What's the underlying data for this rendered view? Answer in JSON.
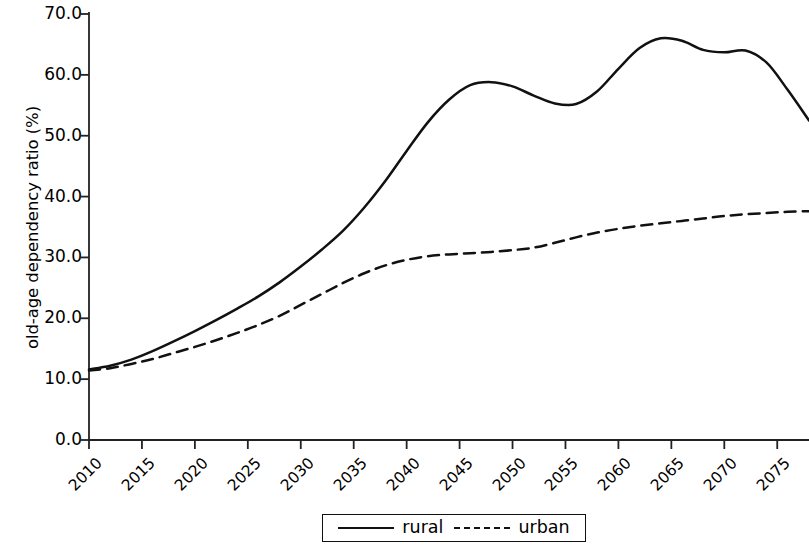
{
  "chart_data": {
    "type": "line",
    "title": "",
    "xlabel": "",
    "ylabel": "old-age dependency ratio (%)",
    "xlim": [
      2010,
      2078
    ],
    "ylim": [
      0.0,
      70.0
    ],
    "grid": false,
    "legend_position": "bottom-center",
    "x_tick_labels": [
      "2010",
      "2015",
      "2020",
      "2025",
      "2030",
      "2035",
      "2040",
      "2045",
      "2050",
      "2055",
      "2060",
      "2065",
      "2070",
      "2075"
    ],
    "y_tick_labels": [
      "0.0",
      "10.0",
      "20.0",
      "30.0",
      "40.0",
      "50.0",
      "60.0",
      "70.0"
    ],
    "y_tick_values": [
      0.0,
      10.0,
      20.0,
      30.0,
      40.0,
      50.0,
      60.0,
      70.0
    ],
    "x": [
      2010,
      2012,
      2014,
      2016,
      2018,
      2020,
      2022,
      2024,
      2026,
      2028,
      2030,
      2032,
      2034,
      2036,
      2038,
      2040,
      2042,
      2044,
      2046,
      2048,
      2050,
      2052,
      2054,
      2056,
      2058,
      2060,
      2062,
      2064,
      2066,
      2068,
      2070,
      2072,
      2074,
      2076,
      2078
    ],
    "series": [
      {
        "name": "rural",
        "style": "solid",
        "color": "#111111",
        "values": [
          11.6,
          12.2,
          13.2,
          14.6,
          16.2,
          17.9,
          19.7,
          21.6,
          23.6,
          25.9,
          28.5,
          31.3,
          34.4,
          38.2,
          42.6,
          47.5,
          52.2,
          55.9,
          58.3,
          58.8,
          58.1,
          56.6,
          55.3,
          55.2,
          57.3,
          61.0,
          64.4,
          66.0,
          65.6,
          64.1,
          63.7,
          64.0,
          62.0,
          57.5,
          52.5
        ]
      },
      {
        "name": "urban",
        "style": "dashed",
        "color": "#111111",
        "values": [
          11.4,
          11.8,
          12.5,
          13.3,
          14.3,
          15.3,
          16.4,
          17.6,
          18.9,
          20.4,
          22.2,
          24.0,
          25.8,
          27.4,
          28.7,
          29.6,
          30.2,
          30.5,
          30.7,
          30.9,
          31.2,
          31.6,
          32.4,
          33.3,
          34.1,
          34.7,
          35.2,
          35.6,
          36.0,
          36.4,
          36.8,
          37.1,
          37.3,
          37.5,
          37.6
        ]
      }
    ],
    "annotations": {
      "rural_peak_year": 2061,
      "rural_peak_value": 66.0,
      "rural_local_max_2045": 58.8,
      "rural_local_min_2052": 55.2,
      "urban_end_value": 37.6,
      "rural_end_value": 49.4
    }
  },
  "legend": {
    "entries": [
      {
        "label": "rural",
        "style": "solid"
      },
      {
        "label": "urban",
        "style": "dashed"
      }
    ]
  }
}
